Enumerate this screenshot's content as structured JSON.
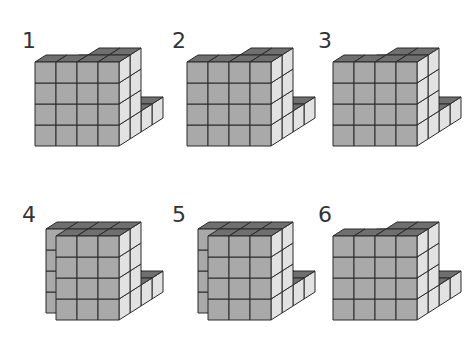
{
  "colors": {
    "front": "#a9a9a9",
    "top": "#6f6f6f",
    "side": "#e2e2e2",
    "edge": "#2a2a2a"
  },
  "figures": [
    {
      "label": "1",
      "heights": [
        [
          3,
          3,
          1,
          1
        ],
        [
          2,
          0,
          0,
          1
        ],
        [
          2,
          0,
          4,
          4
        ],
        [
          4,
          4,
          4,
          4
        ]
      ]
    },
    {
      "label": "2",
      "heights": [
        [
          3,
          3,
          1,
          1
        ],
        [
          3,
          2,
          1,
          1
        ],
        [
          0,
          0,
          4,
          4
        ],
        [
          4,
          4,
          4,
          4
        ]
      ]
    },
    {
      "label": "3",
      "heights": [
        [
          3,
          3,
          1,
          1
        ],
        [
          3,
          0,
          2,
          1
        ],
        [
          0,
          0,
          4,
          4
        ],
        [
          4,
          4,
          4,
          4
        ]
      ]
    },
    {
      "label": "4",
      "heights": [
        [
          3,
          2,
          1,
          1
        ],
        [
          3,
          0,
          0,
          1
        ],
        [
          4,
          4,
          4,
          4
        ],
        [
          0,
          4,
          4,
          4
        ]
      ]
    },
    {
      "label": "5",
      "heights": [
        [
          3,
          3,
          1,
          1
        ],
        [
          0,
          0,
          0,
          1
        ],
        [
          4,
          4,
          4,
          4
        ],
        [
          0,
          4,
          4,
          4
        ]
      ]
    },
    {
      "label": "6",
      "heights": [
        [
          3,
          3,
          1,
          1
        ],
        [
          3,
          3,
          2,
          1
        ],
        [
          0,
          0,
          4,
          4
        ],
        [
          4,
          4,
          4,
          4
        ]
      ]
    }
  ]
}
